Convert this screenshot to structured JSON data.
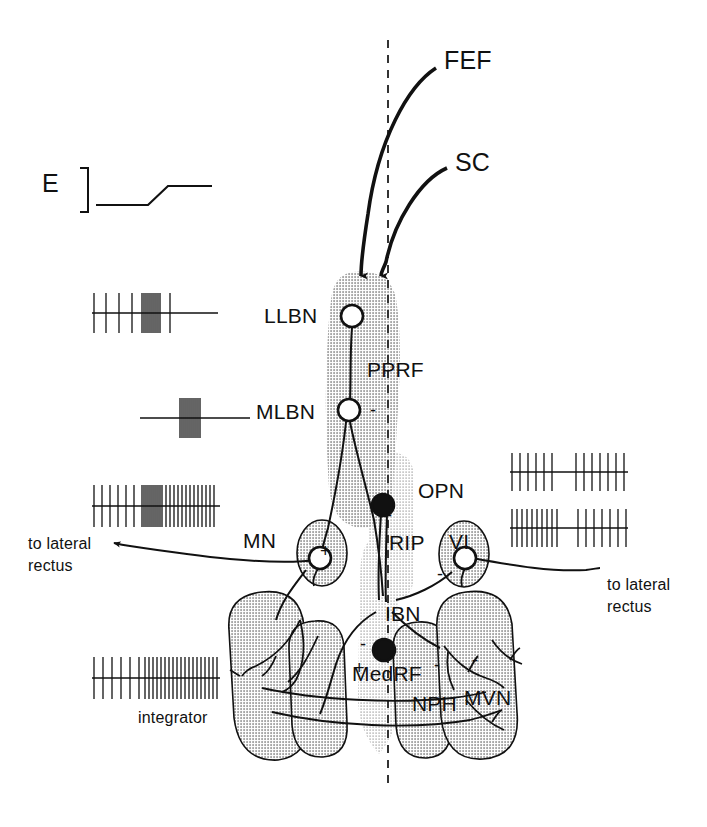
{
  "figure": {
    "midline_label": "midline",
    "colors": {
      "ink": "#111111",
      "shade_dark": "#b4b4b4",
      "shade_mid": "#c2c2c2",
      "shade_light": "#d6d6d6",
      "background": "#ffffff"
    }
  },
  "inputs": [
    {
      "id": "fef",
      "label": "FEF",
      "x": 444,
      "y": 46
    },
    {
      "id": "sc",
      "label": "SC",
      "x": 455,
      "y": 148
    }
  ],
  "regions": [
    {
      "id": "pprf",
      "label": "PPRF",
      "x": 367,
      "y": 358
    },
    {
      "id": "opn",
      "label": "OPN",
      "x": 418,
      "y": 479
    },
    {
      "id": "rip",
      "label": "RIP",
      "x": 389,
      "y": 531
    },
    {
      "id": "medrf",
      "label": "MedRF",
      "x": 352,
      "y": 662
    },
    {
      "id": "nph",
      "label": "NPH",
      "x": 412,
      "y": 692
    },
    {
      "id": "mvn",
      "label": "MVN",
      "x": 464,
      "y": 686
    }
  ],
  "neurons": [
    {
      "id": "llbn",
      "label": "LLBN",
      "x": 264,
      "y": 304,
      "type": "open",
      "sign": ""
    },
    {
      "id": "mlbn",
      "label": "MLBN",
      "x": 256,
      "y": 400,
      "type": "open",
      "sign": "-"
    },
    {
      "id": "mn",
      "label": "MN",
      "x": 243,
      "y": 529,
      "type": "open",
      "sign": "+"
    },
    {
      "id": "vi",
      "label": "VI",
      "x": 449,
      "y": 530,
      "type": "open",
      "sign": "-"
    },
    {
      "id": "ibn",
      "label": "IBN",
      "x": 385,
      "y": 602,
      "type": "filled",
      "sign": "-"
    }
  ],
  "sign_marks": [
    {
      "id": "mlbn-inhib",
      "text": "-",
      "x": 370,
      "y": 400
    },
    {
      "id": "opn-inhib",
      "text": "-",
      "x": 386,
      "y": 505
    },
    {
      "id": "mn-excit",
      "text": "+",
      "x": 320,
      "y": 541
    },
    {
      "id": "vi-inhib",
      "text": "-",
      "x": 437,
      "y": 564
    },
    {
      "id": "ibn-inhib",
      "text": "-",
      "x": 360,
      "y": 634
    },
    {
      "id": "ibn-excit",
      "text": "+",
      "x": 354,
      "y": 658
    },
    {
      "id": "nph-inhib",
      "text": "-",
      "x": 434,
      "y": 655
    },
    {
      "id": "nph-inhib2",
      "text": "-",
      "x": 472,
      "y": 650
    }
  ],
  "output_labels": [
    {
      "id": "out-left",
      "line1": "to lateral",
      "line2": "rectus",
      "x": 28,
      "y": 535
    },
    {
      "id": "out-right",
      "line1": "to lateral",
      "line2": "rectus",
      "x": 607,
      "y": 576
    }
  ],
  "trace_E": {
    "label": "E",
    "label_x": 42,
    "label_y": 169,
    "bracket_x": 76,
    "description": "eye position step"
  },
  "integrator_caption": {
    "label": "integrator",
    "x": 138,
    "y": 709
  },
  "chart_data": {
    "type": "raster",
    "traces": [
      {
        "id": "trace-llbn",
        "name": "LLBN",
        "x": 92,
        "y": 313,
        "width": 126,
        "baseline_width": 126,
        "pattern": "tonic-low then burst then silence",
        "spike_times": [
          2,
          14,
          27,
          40,
          50,
          52,
          54,
          56,
          58,
          60,
          62,
          64,
          66,
          68,
          78
        ],
        "spike_height": 20
      },
      {
        "id": "trace-mlbn",
        "name": "MLBN",
        "x": 140,
        "y": 418,
        "width": 110,
        "baseline_width": 110,
        "pattern": "silence then high-frequency burst then silence",
        "spike_times": [
          40,
          42,
          44,
          46,
          48,
          50,
          52,
          54,
          56,
          58,
          60
        ],
        "spike_height": 20
      },
      {
        "id": "trace-mn",
        "name": "MN",
        "x": 92,
        "y": 506,
        "width": 128,
        "baseline_width": 128,
        "pattern": "low tonic rate then burst then elevated tonic rate",
        "spike_times": [
          2,
          10,
          18,
          26,
          34,
          42,
          50,
          52,
          54,
          56,
          58,
          60,
          62,
          64,
          66,
          68,
          70,
          74,
          78,
          82,
          86,
          90,
          94,
          98,
          102,
          106,
          110,
          114,
          118,
          122
        ],
        "spike_height": 21
      },
      {
        "id": "trace-opn-upper",
        "name": "OPN-upper",
        "x": 510,
        "y": 472,
        "width": 118,
        "baseline_width": 118,
        "pattern": "tonic firing with mid pause",
        "spike_times": [
          2,
          10,
          18,
          26,
          34,
          42,
          66,
          74,
          82,
          90,
          98,
          106,
          114
        ],
        "spike_height": 19
      },
      {
        "id": "trace-opn-lower",
        "name": "OPN-lower",
        "x": 510,
        "y": 528,
        "width": 118,
        "baseline_width": 118,
        "pattern": "tonic firing with mid pause",
        "spike_times": [
          2,
          7,
          12,
          17,
          22,
          27,
          32,
          37,
          42,
          47,
          68,
          76,
          84,
          92,
          100,
          108,
          116
        ],
        "spike_height": 19
      },
      {
        "id": "trace-integrator",
        "name": "integrator",
        "x": 92,
        "y": 678,
        "width": 128,
        "baseline_width": 128,
        "pattern": "low tonic rate stepping to sustained high rate",
        "spike_times": [
          2,
          11,
          20,
          29,
          38,
          47,
          53,
          57,
          61,
          65,
          69,
          73,
          77,
          81,
          85,
          89,
          93,
          97,
          101,
          105,
          109,
          113,
          117,
          121,
          125
        ],
        "spike_height": 21
      }
    ]
  }
}
